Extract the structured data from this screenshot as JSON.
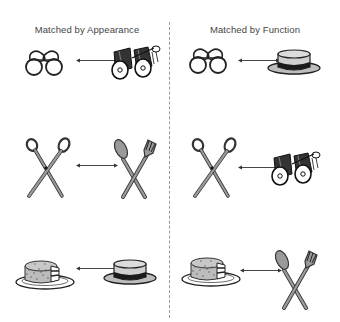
{
  "columns": [
    {
      "title": "Matched by Appearance",
      "center_x": 87
    },
    {
      "title": "Matched by Function",
      "center_x": 255
    }
  ],
  "rows": [
    {
      "left": {
        "a": "eyeglasses",
        "b": "binoculars"
      },
      "right": {
        "a": "eyeglasses",
        "b": "hat"
      }
    },
    {
      "left": {
        "a": "scissors",
        "b": "spoon-and-fork"
      },
      "right": {
        "a": "scissors",
        "b": "binoculars"
      }
    },
    {
      "left": {
        "a": "cake-on-plate",
        "b": "hat"
      },
      "right": {
        "a": "cake-on-plate",
        "b": "spoon-and-fork"
      }
    }
  ],
  "relation_symbol": "double-headed-arrow",
  "colors": {
    "line": "#222222",
    "fill_gray": "#9a9a9a",
    "light_gray": "#cfcfcf",
    "divider": "#999999"
  }
}
